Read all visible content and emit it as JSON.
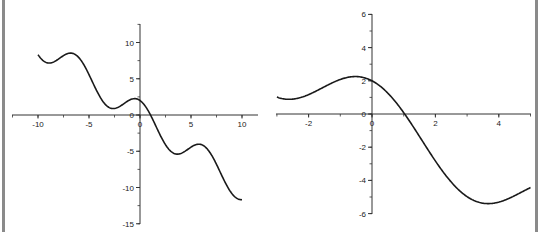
{
  "chart_data": [
    {
      "type": "line",
      "title": "",
      "xlabel": "",
      "ylabel": "",
      "function": "y = 2cos(x) - x",
      "xlim": [
        -12.5,
        11.5
      ],
      "ylim": [
        -15,
        12.5
      ],
      "grid": false,
      "x_ticks": [
        -10,
        -5,
        0,
        5,
        10
      ],
      "x_tick_labels": [
        "-10",
        "-5",
        "0",
        "5",
        "10"
      ],
      "y_ticks": [
        10,
        5,
        0,
        -5,
        -10,
        -15
      ],
      "y_tick_labels": [
        "10",
        "5",
        "0",
        "-5",
        "-10",
        "-15"
      ],
      "series": [
        {
          "name": "curve",
          "x_range": [
            -10,
            10
          ],
          "x": [
            -10,
            -9,
            -8,
            -7,
            -6,
            -5,
            -4,
            -3,
            -2,
            -1,
            0,
            1,
            2,
            3,
            4,
            5,
            6,
            7,
            8,
            9,
            10
          ],
          "values": [
            8.32,
            7.18,
            7.71,
            8.51,
            7.92,
            5.57,
            2.69,
            1.02,
            1.17,
            2.08,
            2.0,
            0.08,
            -2.83,
            -4.98,
            -5.31,
            -4.43,
            -4.08,
            -5.49,
            -8.29,
            -10.82,
            -11.68
          ]
        }
      ]
    },
    {
      "type": "line",
      "title": "",
      "xlabel": "",
      "ylabel": "",
      "function": "y = 2cos(x) - x",
      "xlim": [
        -3,
        5
      ],
      "ylim": [
        -6,
        6
      ],
      "grid": false,
      "x_ticks": [
        -2,
        0,
        2,
        4
      ],
      "x_tick_labels": [
        "-2",
        "0",
        "2",
        "4"
      ],
      "y_ticks": [
        6,
        4,
        2,
        0,
        -2,
        -4,
        -6
      ],
      "y_tick_labels": [
        "6",
        "4",
        "2",
        "0",
        "-2",
        "-4",
        "-6"
      ],
      "series": [
        {
          "name": "curve",
          "x_range": [
            -3,
            5
          ],
          "x": [
            -3,
            -2.5,
            -2,
            -1.5,
            -1,
            -0.5,
            0,
            0.5,
            1,
            1.5,
            2,
            2.5,
            3,
            3.5,
            4,
            4.5,
            5
          ],
          "values": [
            1.02,
            0.9,
            1.17,
            1.64,
            2.08,
            2.26,
            2.0,
            1.26,
            0.08,
            -1.36,
            -2.83,
            -4.1,
            -4.98,
            -5.37,
            -5.31,
            -4.92,
            -4.43
          ]
        }
      ]
    }
  ]
}
